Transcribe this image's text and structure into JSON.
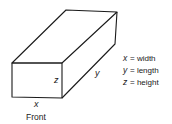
{
  "diagram": {
    "type": "rectangular-box",
    "labels": {
      "front_width": "x",
      "front_height": "z",
      "side_length": "y",
      "front_caption": "Front"
    },
    "legend": [
      {
        "var": "x",
        "eq": "= width"
      },
      {
        "var": "y",
        "eq": "= length"
      },
      {
        "var": "z",
        "eq": "= height"
      }
    ],
    "colors": {
      "stroke": "#1a1a1a",
      "background": "#ffffff"
    }
  }
}
